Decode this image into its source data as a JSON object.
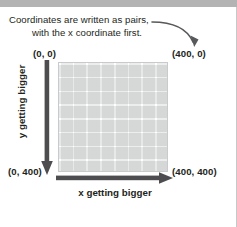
{
  "figure": {
    "title_caption": {
      "line1": "Coordinates are written as pairs,",
      "line2": "with the x coordinate first."
    },
    "corner_labels": {
      "top_left": "(0, 0)",
      "top_right": "(400, 0)",
      "bottom_left": "(0, 400)",
      "bottom_right": "(400, 400)"
    },
    "axis_labels": {
      "y": "y getting bigger",
      "x": "x getting bigger"
    },
    "icons": {
      "curved_arrow": "curved-arrow-down-right-icon",
      "down_arrow": "arrow-down-icon",
      "right_arrow": "arrow-right-icon"
    },
    "colors": {
      "text": "#231f20",
      "arrow": "#4d4d4f",
      "grid_line": "#ffffff",
      "grid_fill": "#ececec",
      "grid_border": "#c9cacb",
      "top_band": "#b3b3b3",
      "page_background": "#ffffff"
    },
    "grid": {
      "columns": 8,
      "rows": 8,
      "x_min": 0,
      "x_max": 400,
      "y_min": 0,
      "y_max": 400
    }
  }
}
